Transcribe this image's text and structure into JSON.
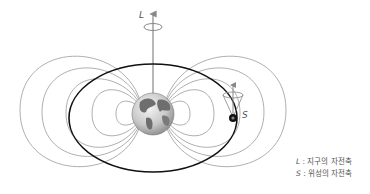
{
  "diagram": {
    "labels": {
      "earth_axis": "L",
      "satellite_axis": "S"
    },
    "legend": [
      {
        "symbol": "L",
        "separator": " : ",
        "text": "지구의 자전축"
      },
      {
        "symbol": "S",
        "separator": " : ",
        "text": "위성의 자전축"
      }
    ],
    "colors": {
      "field_lines": "#9a9a9a",
      "orbit": "#111111",
      "axis": "#888888",
      "earth_land": "#6e6e6e",
      "earth_ocean": "#d8d8d8",
      "text": "#555555"
    }
  }
}
